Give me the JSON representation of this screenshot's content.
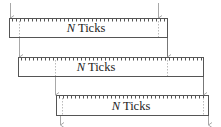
{
  "diagram": {
    "title": "",
    "boxes": [
      {
        "id": "box-1",
        "label_var": "N",
        "label_text": " Ticks",
        "x": 9,
        "y": 18,
        "w": 158,
        "h": 19
      },
      {
        "id": "box-2",
        "label_var": "N",
        "label_text": " Ticks",
        "x": 18,
        "y": 57,
        "w": 185,
        "h": 19
      },
      {
        "id": "box-3",
        "label_var": "N",
        "label_text": " Ticks",
        "x": 56,
        "y": 95,
        "w": 152,
        "h": 20
      }
    ],
    "tick_spacing": 4,
    "colors": {
      "box_stroke": "#555555",
      "arrow": "#a8a8a8",
      "dotted": "#bbbbbb",
      "text": "#222222"
    }
  }
}
